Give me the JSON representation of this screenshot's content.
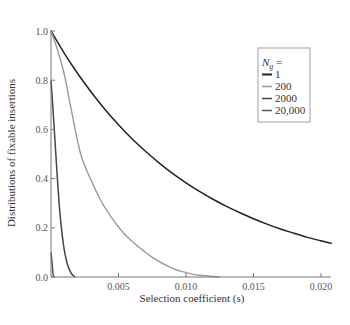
{
  "chart_data": {
    "type": "line",
    "title": "",
    "xlabel": "Selection coefficient (s)",
    "ylabel": "Distributions of fixable insertions",
    "xlim": [
      0,
      0.0208
    ],
    "ylim": [
      0,
      1.0
    ],
    "grid": false,
    "x_ticks": [
      "0.005",
      "0.010",
      "0.015",
      "0.020"
    ],
    "x_tick_values": [
      0.005,
      0.01,
      0.015,
      0.02
    ],
    "y_ticks": [
      "0.0",
      "0.2",
      "0.4",
      "0.6",
      "0.8",
      "1.0"
    ],
    "y_tick_values": [
      0.0,
      0.2,
      0.4,
      0.6,
      0.8,
      1.0
    ],
    "legend": {
      "title": "N",
      "title_subscript": "g",
      "title_suffix": " =",
      "position": "upper right",
      "entries": [
        "1",
        "200",
        "2000",
        "20,000"
      ]
    },
    "series": [
      {
        "name": "1",
        "color": "#222222",
        "x": [
          0,
          0.001,
          0.002,
          0.003,
          0.004,
          0.005,
          0.006,
          0.007,
          0.008,
          0.009,
          0.01,
          0.011,
          0.012,
          0.013,
          0.014,
          0.015,
          0.016,
          0.017,
          0.018,
          0.019,
          0.02,
          0.0208
        ],
        "y": [
          1.0,
          0.908,
          0.825,
          0.75,
          0.681,
          0.619,
          0.562,
          0.511,
          0.464,
          0.421,
          0.383,
          0.348,
          0.316,
          0.287,
          0.261,
          0.237,
          0.215,
          0.195,
          0.178,
          0.161,
          0.147,
          0.136
        ]
      },
      {
        "name": "200",
        "color": "#9a9a9a",
        "x": [
          0,
          0.0005,
          0.001,
          0.0015,
          0.0022,
          0.003,
          0.0037,
          0.0045,
          0.0052,
          0.006,
          0.0075,
          0.009,
          0.01,
          0.011,
          0.0125
        ],
        "y": [
          1.0,
          0.92,
          0.82,
          0.68,
          0.5,
          0.39,
          0.31,
          0.24,
          0.19,
          0.145,
          0.08,
          0.035,
          0.018,
          0.007,
          0.0
        ]
      },
      {
        "name": "2000",
        "color": "#444444",
        "x": [
          0,
          0.00015,
          0.0003,
          0.00045,
          0.0006,
          0.00075,
          0.0009,
          0.00105,
          0.0012,
          0.0014,
          0.0016,
          0.0018
        ],
        "y": [
          0.8,
          0.68,
          0.55,
          0.42,
          0.3,
          0.21,
          0.14,
          0.09,
          0.055,
          0.025,
          0.008,
          0.0
        ]
      },
      {
        "name": "20,000",
        "color": "#555555",
        "x": [
          0,
          5e-05,
          0.0001,
          0.00015,
          0.0002
        ],
        "y": [
          0.1,
          0.075,
          0.045,
          0.015,
          0.0
        ]
      }
    ]
  }
}
